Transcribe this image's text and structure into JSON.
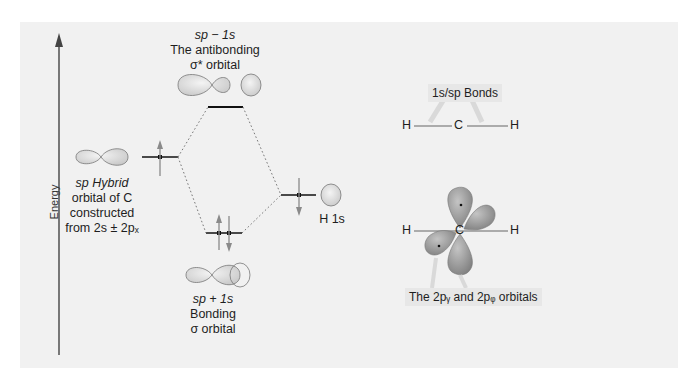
{
  "axis": {
    "label": "Energy"
  },
  "labels": {
    "antibonding": {
      "line1": "sp − 1s",
      "line2": "The antibonding",
      "line3": "σ* orbital"
    },
    "bonding": {
      "line1": "sp + 1s",
      "line2": "Bonding",
      "line3": "σ orbital"
    },
    "hybrid": {
      "line1": "sp Hybrid",
      "line2": "orbital of C",
      "line3": "constructed",
      "line4": "from 2s ± 2pₓ"
    },
    "h1s": "H 1s"
  },
  "right_panel": {
    "bonds_tag": "1s/sp Bonds",
    "orbitals_tag": "The 2pᵧ and 2pᵩ orbitals",
    "molecule_top": {
      "left": "H",
      "center": "C",
      "right": "H"
    },
    "molecule_bottom": {
      "left": "H",
      "center": "C",
      "right": "H"
    }
  },
  "colors": {
    "background": "#f1f1f1",
    "orbital_fill": "#dcdcdc",
    "orbital_dark": "#8e8e8e",
    "level_line": "#111111",
    "arrow": "#8a8a8a"
  }
}
